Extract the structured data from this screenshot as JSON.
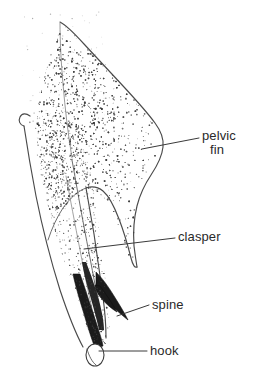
{
  "figure": {
    "type": "labeled-anatomical-line-drawing",
    "background_color": "#ffffff",
    "ink_color": "#2a2a2a",
    "render_style": "stipple-and-line engraving"
  },
  "labels": [
    {
      "id": "pelvic-fin",
      "line1": "pelvic",
      "line2": "fin",
      "text_x": 202,
      "text_y": 140,
      "leader": {
        "x1": 142,
        "y1": 149,
        "x2": 199,
        "y2": 138
      }
    },
    {
      "id": "clasper",
      "line1": "clasper",
      "line2": "",
      "text_x": 178,
      "text_y": 241,
      "leader": {
        "x1": 84,
        "y1": 249,
        "x2": 175,
        "y2": 238
      }
    },
    {
      "id": "spine",
      "line1": "spine",
      "line2": "",
      "text_x": 152,
      "text_y": 309,
      "leader": {
        "x1": 117,
        "y1": 316,
        "x2": 149,
        "y2": 305
      }
    },
    {
      "id": "hook",
      "line1": "hook",
      "line2": "",
      "text_x": 150,
      "text_y": 355,
      "leader": {
        "x1": 99,
        "y1": 351,
        "x2": 147,
        "y2": 351
      }
    }
  ],
  "anatomy": {
    "parts": [
      {
        "name": "pelvic fin",
        "description": "large triangular stippled fin occupying the upper body of the figure"
      },
      {
        "name": "clasper",
        "description": "elongate tapering intromittent organ extending ventrally from the inner fin margin"
      },
      {
        "name": "spine",
        "description": "dark pointed projection on the outer edge near the clasper tip"
      },
      {
        "name": "hook",
        "description": "small pale rounded hook at the distal end of the clasper"
      }
    ]
  },
  "stipple": {
    "dot_color": "#3b3b3b",
    "seed": 20240517,
    "density_note": "dense along left and central fin surface, sparse toward upper right"
  }
}
